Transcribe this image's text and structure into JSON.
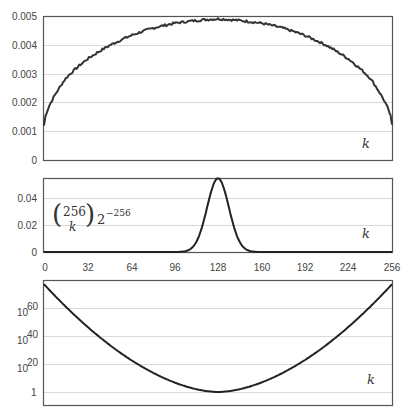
{
  "chart_data": [
    {
      "id": "top",
      "type": "line",
      "title": "",
      "xlabel": "k",
      "ylabel": "",
      "xlim": [
        0,
        256
      ],
      "ylim": [
        0,
        0.005
      ],
      "yticks": [
        "0",
        "0.001",
        "0.002",
        "0.003",
        "0.004",
        "0.005"
      ],
      "grid": true,
      "description": "Noisy semicircle-like curve, ~0.0012 at k=0 and k=256, peaking ~0.0049 near k=128",
      "x": [
        0,
        16,
        32,
        48,
        64,
        80,
        96,
        112,
        128,
        144,
        160,
        176,
        192,
        208,
        224,
        240,
        256
      ],
      "values": [
        0.0012,
        0.0026,
        0.0033,
        0.0038,
        0.0042,
        0.0045,
        0.0047,
        0.0048,
        0.0049,
        0.0048,
        0.0047,
        0.0045,
        0.0042,
        0.0038,
        0.0033,
        0.0026,
        0.0012
      ]
    },
    {
      "id": "middle",
      "type": "line",
      "title": "",
      "annotation": "C(256,k) 2^-256",
      "xlabel": "k",
      "xlim": [
        0,
        256
      ],
      "ylim": [
        0,
        0.05
      ],
      "yticks": [
        "0",
        "0.02",
        "0.04"
      ],
      "xticks": [
        "0",
        "32",
        "64",
        "96",
        "128",
        "160",
        "192",
        "224",
        "256"
      ],
      "grid": true,
      "description": "Binomial distribution peak at k=128, max ~0.05",
      "x": [
        96,
        104,
        112,
        120,
        124,
        128,
        132,
        136,
        144,
        152,
        160
      ],
      "values": [
        0.0,
        0.0009,
        0.0066,
        0.0301,
        0.0445,
        0.0498,
        0.0445,
        0.0301,
        0.0066,
        0.0009,
        0.0
      ]
    },
    {
      "id": "bottom",
      "type": "line",
      "title": "",
      "xlabel": "k",
      "xlim": [
        0,
        256
      ],
      "yscale": "log",
      "yticks": [
        "1",
        "10^20",
        "10^40",
        "10^60"
      ],
      "grid": true,
      "description": "U-shaped curve on log scale: ~10^77 at k=0 and k=256, minimum ~1 at k=128",
      "x": [
        0,
        32,
        64,
        96,
        128,
        160,
        192,
        224,
        256
      ],
      "values_log10": [
        77,
        42,
        18,
        4.5,
        0,
        4.5,
        18,
        42,
        77
      ]
    }
  ],
  "labels": {
    "k": "k",
    "formula_top": "256",
    "formula_bottom": "k",
    "formula_factor": "2",
    "formula_exp": "−256",
    "ten": "10",
    "exp60": "60",
    "exp40": "40",
    "exp20": "20",
    "one": "1"
  }
}
